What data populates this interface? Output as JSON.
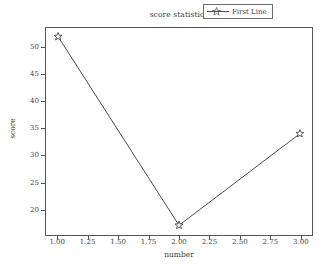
{
  "chart_data": {
    "type": "line",
    "title": "score statistics",
    "xlabel": "number",
    "ylabel": "score",
    "x": [
      1,
      2,
      3
    ],
    "values": [
      52,
      17,
      34
    ],
    "series": [
      {
        "name": "First Line",
        "x": [
          1,
          2,
          3
        ],
        "values": [
          52,
          17,
          34
        ]
      }
    ],
    "legend": {
      "entries": [
        "First Line"
      ],
      "position": "upper right"
    },
    "xlim": [
      0.9,
      3.1
    ],
    "ylim": [
      15.2,
      53.6
    ],
    "xticks": [
      1.0,
      1.25,
      1.5,
      1.75,
      2.0,
      2.25,
      2.5,
      2.75,
      3.0
    ],
    "xtick_labels": [
      "1.00",
      "1.25",
      "1.50",
      "1.75",
      "2.00",
      "2.25",
      "2.50",
      "2.75",
      "3.00"
    ],
    "yticks": [
      20,
      25,
      30,
      35,
      40,
      45,
      50
    ],
    "ytick_labels": [
      "20",
      "25",
      "30",
      "35",
      "40",
      "45",
      "50"
    ],
    "grid": false,
    "marker": "star",
    "line_color": "#4a4a4a",
    "marker_color": "#4a4a4a",
    "background_color": "#ffffff",
    "axis_color": "#55565a"
  }
}
